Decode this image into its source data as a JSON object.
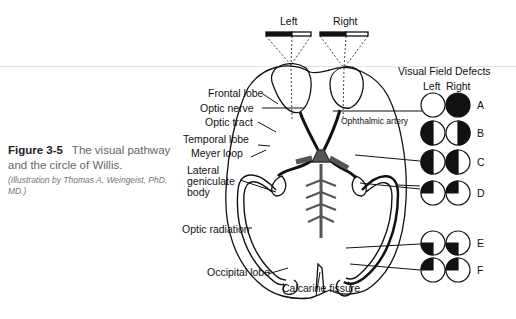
{
  "caption": {
    "figure_number": "Figure 3-5",
    "title": "The visual pathway and the circle of Willis.",
    "credit": "(Illustration by Thomas A. Weingeist, PhD, MD.)"
  },
  "eye_labels": {
    "left": "Left",
    "right": "Right"
  },
  "anatomy_labels": {
    "frontal_lobe": "Frontal lobe",
    "optic_nerve": "Optic nerve",
    "optic_tract": "Optic tract",
    "temporal_lobe": "Temporal lobe",
    "meyer_loop": "Meyer loop",
    "lgb_1": "Lateral",
    "lgb_2": "geniculate",
    "lgb_3": "body",
    "optic_radiation": "Optic radiation",
    "occipital_lobe": "Occipital lobe",
    "calcarine_fissure": "Calcarine fissure",
    "ophthalmic_artery": "Ophthalmic artery"
  },
  "visual_field_defects": {
    "title": "Visual Field Defects",
    "col_left": "Left",
    "col_right": "Right",
    "rows": [
      {
        "label": "A",
        "left": "normal",
        "right": "complete loss"
      },
      {
        "label": "B",
        "left": "temporal hemianopia (left half black)",
        "right": "temporal hemianopia (right half black)"
      },
      {
        "label": "C",
        "left": "left homonymous hemianopia",
        "right": "left homonymous hemianopia"
      },
      {
        "label": "D",
        "left": "left superior quadrantanopia",
        "right": "left superior quadrantanopia"
      },
      {
        "label": "E",
        "left": "left inferior quadrantanopia",
        "right": "left inferior quadrantanopia"
      },
      {
        "label": "F",
        "left": "left superior quadrantanopia",
        "right": "left superior quadrantanopia"
      }
    ]
  }
}
